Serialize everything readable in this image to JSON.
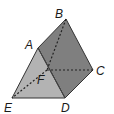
{
  "diagram": {
    "type": "triangular-prism",
    "colors": {
      "front_face": "#b3b3b3",
      "side_face": "#7f7f7f",
      "top_face": "#6e6e6e",
      "edge": "#333333",
      "hidden_edge": "#222222",
      "background": "#ffffff"
    },
    "vertices": {
      "A": {
        "label": "A",
        "x": 38,
        "y": 48
      },
      "B": {
        "label": "B",
        "x": 66,
        "y": 19
      },
      "C": {
        "label": "C",
        "x": 93,
        "y": 70
      },
      "D": {
        "label": "D",
        "x": 65,
        "y": 98
      },
      "E": {
        "label": "E",
        "x": 12,
        "y": 98
      },
      "F": {
        "label": "F",
        "x": 47,
        "y": 70
      }
    },
    "labels": {
      "A": "A",
      "B": "B",
      "C": "C",
      "D": "D",
      "E": "E",
      "F": "F"
    },
    "visible_edges": [
      "AB",
      "BC",
      "CD",
      "DE",
      "EA",
      "AD"
    ],
    "hidden_edges": [
      "BF",
      "FC",
      "FE"
    ]
  }
}
